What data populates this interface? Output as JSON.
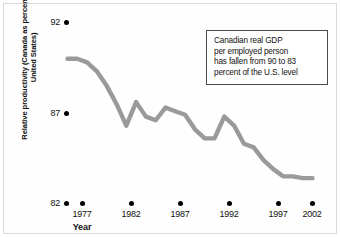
{
  "chart_data": {
    "type": "line",
    "title": "",
    "xlabel": "Year",
    "ylabel": "Relative productivity (Canada as percentage of United States)",
    "xlim": [
      1977,
      2002
    ],
    "ylim": [
      82,
      92
    ],
    "xticks": [
      "1977",
      "1982",
      "1987",
      "1992",
      "1997",
      "2002"
    ],
    "yticks": [
      "92",
      "87",
      "82"
    ],
    "grid": false,
    "legend": null,
    "line_color": "#9a9a9a",
    "x": [
      1977,
      1978,
      1979,
      1980,
      1981,
      1982,
      1983,
      1984,
      1985,
      1986,
      1987,
      1988,
      1989,
      1990,
      1991,
      1992,
      1993,
      1994,
      1995,
      1996,
      1997,
      1998,
      1999,
      2000,
      2001,
      2002
    ],
    "values": [
      90.0,
      90.0,
      89.8,
      89.3,
      88.5,
      87.5,
      86.3,
      87.6,
      86.8,
      86.6,
      87.3,
      87.1,
      86.9,
      86.1,
      85.6,
      85.6,
      86.8,
      86.3,
      85.3,
      85.1,
      84.4,
      83.9,
      83.5,
      83.5,
      83.4,
      83.4
    ],
    "annotations": [
      {
        "name": "callout-box",
        "lines": [
          "Canadian real GDP",
          "per employed person",
          "has fallen from 90 to 83",
          "percent of the U.S. level"
        ]
      }
    ]
  },
  "axis": {
    "y_title": "Relative productivity (Canada as percentage of United States)",
    "x_title": "Year"
  }
}
